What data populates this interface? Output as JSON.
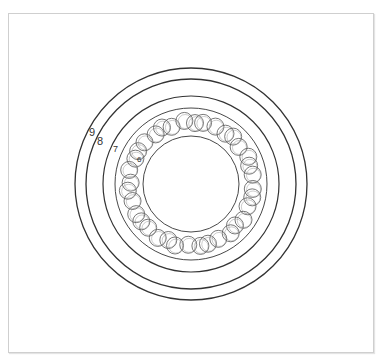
{
  "diagram": {
    "type": "bearing-cross-section",
    "center": {
      "x": 191,
      "y": 184
    },
    "stroke_color": "#333333",
    "ball_stroke_color": "#555555",
    "rings": [
      {
        "id": "ring-9",
        "label": "9",
        "r": 116,
        "width": 1.3
      },
      {
        "id": "ring-8",
        "label": "8",
        "r": 105,
        "width": 1.3
      },
      {
        "id": "ring-7",
        "label": "7",
        "r": 88,
        "width": 1.2
      },
      {
        "id": "outer-race",
        "label": "",
        "r": 76,
        "width": 0.9
      },
      {
        "id": "inner-race",
        "label": "6",
        "r": 48,
        "width": 0.9
      }
    ],
    "balls": {
      "count": 36,
      "orbit_r": 62,
      "ball_r": 8.5
    },
    "labels": [
      {
        "text": "9",
        "x": 89,
        "y": 136,
        "size": 11
      },
      {
        "text": "8",
        "x": 97,
        "y": 145,
        "size": 11
      },
      {
        "text": "7",
        "x": 113,
        "y": 152,
        "size": 9
      },
      {
        "text": "6",
        "x": 137,
        "y": 162,
        "size": 8
      }
    ]
  }
}
